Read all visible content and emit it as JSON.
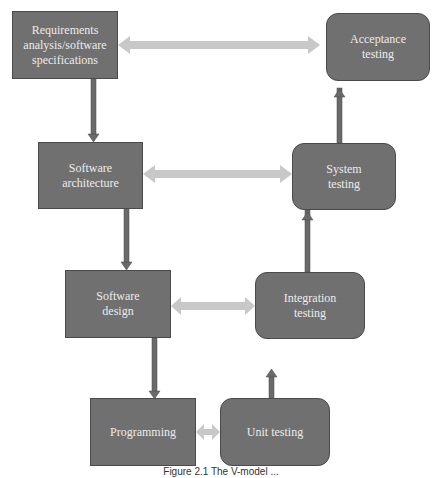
{
  "diagram": {
    "type": "V-model flowchart",
    "left_branch": [
      {
        "id": "requirements",
        "label": "Requirements\nanalysis/software\nspecifications"
      },
      {
        "id": "architecture",
        "label": "Software\narchitecture"
      },
      {
        "id": "design",
        "label": "Software\ndesign"
      },
      {
        "id": "programming",
        "label": "Programming"
      }
    ],
    "right_branch": [
      {
        "id": "unit",
        "label": "Unit testing"
      },
      {
        "id": "integration",
        "label": "Integration\ntesting"
      },
      {
        "id": "system",
        "label": "System\ntesting"
      },
      {
        "id": "acceptance",
        "label": "Acceptance\ntesting"
      }
    ],
    "links": [
      {
        "from": "requirements",
        "to": "acceptance",
        "style": "double-arrow"
      },
      {
        "from": "architecture",
        "to": "system",
        "style": "double-arrow"
      },
      {
        "from": "design",
        "to": "integration",
        "style": "double-arrow"
      },
      {
        "from": "programming",
        "to": "unit",
        "style": "double-arrow"
      }
    ],
    "colors": {
      "box": "#707070",
      "box_text": "#ececec",
      "flow_arrow": "#6e6e6e",
      "link_arrow": "#c8c8c8"
    }
  },
  "caption": "Figure 2.1  The V-model ..."
}
